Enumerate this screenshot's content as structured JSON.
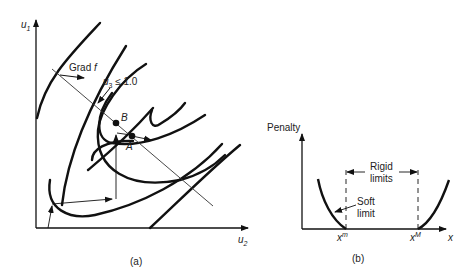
{
  "panel_a": {
    "caption": "(a)",
    "y_axis_label": "u",
    "y_axis_sub": "1",
    "x_axis_label": "u",
    "x_axis_sub": "2",
    "grad_label": "Grad ",
    "grad_var": "f",
    "constraint_label_var": "u",
    "constraint_label_sub": "3",
    "constraint_label_rest": " ≤ 1.0",
    "point_b": "B",
    "point_a": "A"
  },
  "panel_b": {
    "caption": "(b)",
    "y_axis_label": "Penalty",
    "x_axis_label": "x",
    "rigid_label_line1": "Rigid",
    "rigid_label_line2": "limits",
    "soft_label_line1": "Soft",
    "soft_label_line2": "limit",
    "xm_base": "x",
    "xm_sup": "m",
    "xM_base": "x",
    "xM_sup": "M"
  },
  "colors": {
    "ink": "#111111",
    "thin": "#333333"
  }
}
